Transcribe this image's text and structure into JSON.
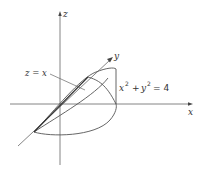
{
  "diagram": {
    "axes": {
      "x_label": "x",
      "y_label": "y",
      "z_label": "z"
    },
    "annotations": {
      "plane": "z = x",
      "cylinder_lhs_x": "x",
      "cylinder_exp1": "2",
      "cylinder_plus": "+",
      "cylinder_lhs_y": "y",
      "cylinder_exp2": "2",
      "cylinder_rhs": "= 4"
    },
    "colors": {
      "line": "#555555",
      "text": "#333333"
    }
  }
}
